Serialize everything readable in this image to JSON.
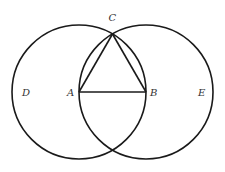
{
  "diagram": {
    "type": "geometric-construction",
    "colors": {
      "stroke": "#1a1a1a",
      "label": "#333333",
      "background": "#ffffff"
    },
    "points": {
      "A": {
        "label": "A",
        "x": 79,
        "y": 92
      },
      "B": {
        "label": "B",
        "x": 146,
        "y": 92
      },
      "C": {
        "label": "C",
        "x": 112.5,
        "y": 34
      },
      "D": {
        "label": "D"
      },
      "E": {
        "label": "E"
      }
    },
    "circles": [
      {
        "name": "circle-centered-A",
        "center": "A",
        "radius": 67,
        "label": "D"
      },
      {
        "name": "circle-centered-B",
        "center": "B",
        "radius": 67,
        "label": "E"
      }
    ],
    "segments": [
      {
        "from": "A",
        "to": "B"
      },
      {
        "from": "A",
        "to": "C"
      },
      {
        "from": "B",
        "to": "C"
      }
    ]
  }
}
